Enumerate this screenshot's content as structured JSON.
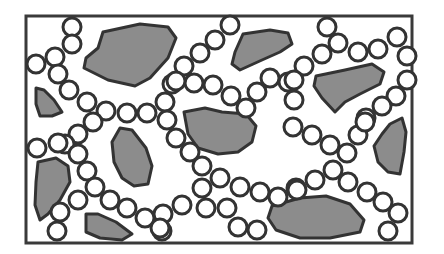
{
  "diagram": {
    "colors": {
      "background": "#ffffff",
      "outline": "#333333",
      "blob_fill": "#8c8c8c",
      "bead_fill": "#ffffff"
    },
    "frame": {
      "x": 26,
      "y": 16,
      "width": 386,
      "height": 227
    },
    "bead_radius": 9,
    "blobs": [
      {
        "points": "103,32 140,24 168,27 176,38 168,58 150,78 135,86 108,80 84,68 86,58 98,48"
      },
      {
        "points": "243,34 270,30 288,33 292,44 280,52 262,60 240,70 232,64 235,52"
      },
      {
        "points": "316,76 345,70 372,64 384,72 380,84 360,94 345,102 335,112 322,98 314,86"
      },
      {
        "points": "36,88 44,90 54,100 62,112 52,116 40,116 36,104"
      },
      {
        "points": "184,112 205,108 222,112 246,114 256,126 252,142 238,152 218,154 198,148 188,134"
      },
      {
        "points": "38,162 56,158 68,166 70,182 60,200 48,214 40,220 35,205 36,182"
      },
      {
        "points": "120,128 132,130 146,148 152,166 148,184 134,186 122,178 114,162 112,142"
      },
      {
        "points": "86,214 98,214 116,222 132,234 122,240 100,238 86,232"
      },
      {
        "points": "390,124 402,118 406,132 404,152 400,174 388,172 378,162 374,146 382,134"
      },
      {
        "points": "272,206 300,198 326,196 350,204 364,220 360,232 330,238 300,238 276,230 268,218"
      }
    ],
    "beads": [
      [
        72,
        27
      ],
      [
        72,
        44
      ],
      [
        55,
        57
      ],
      [
        36,
        64
      ],
      [
        58,
        74
      ],
      [
        69,
        90
      ],
      [
        87,
        102
      ],
      [
        106,
        111
      ],
      [
        127,
        113
      ],
      [
        147,
        113
      ],
      [
        165,
        102
      ],
      [
        172,
        84
      ],
      [
        194,
        83
      ],
      [
        213,
        85
      ],
      [
        231,
        96
      ],
      [
        246,
        108
      ],
      [
        257,
        92
      ],
      [
        270,
        78
      ],
      [
        288,
        82
      ],
      [
        294,
        100
      ],
      [
        230,
        25
      ],
      [
        215,
        40
      ],
      [
        200,
        53
      ],
      [
        184,
        66
      ],
      [
        176,
        81
      ],
      [
        327,
        27
      ],
      [
        338,
        43
      ],
      [
        322,
        54
      ],
      [
        304,
        66
      ],
      [
        358,
        52
      ],
      [
        378,
        49
      ],
      [
        397,
        37
      ],
      [
        407,
        56
      ],
      [
        407,
        80
      ],
      [
        396,
        96
      ],
      [
        382,
        106
      ],
      [
        366,
        118
      ],
      [
        294,
        80
      ],
      [
        93,
        122
      ],
      [
        78,
        134
      ],
      [
        65,
        144
      ],
      [
        58,
        143
      ],
      [
        37,
        148
      ],
      [
        167,
        120
      ],
      [
        176,
        138
      ],
      [
        190,
        152
      ],
      [
        202,
        166
      ],
      [
        220,
        178
      ],
      [
        240,
        187
      ],
      [
        260,
        192
      ],
      [
        278,
        197
      ],
      [
        296,
        188
      ],
      [
        202,
        188
      ],
      [
        182,
        205
      ],
      [
        163,
        214
      ],
      [
        162,
        231
      ],
      [
        206,
        208
      ],
      [
        227,
        208
      ],
      [
        238,
        227
      ],
      [
        257,
        230
      ],
      [
        293,
        127
      ],
      [
        312,
        135
      ],
      [
        330,
        145
      ],
      [
        347,
        153
      ],
      [
        358,
        135
      ],
      [
        365,
        122
      ],
      [
        333,
        170
      ],
      [
        348,
        182
      ],
      [
        367,
        192
      ],
      [
        383,
        202
      ],
      [
        398,
        213
      ],
      [
        388,
        231
      ],
      [
        315,
        180
      ],
      [
        297,
        190
      ],
      [
        78,
        154
      ],
      [
        87,
        171
      ],
      [
        95,
        187
      ],
      [
        78,
        200
      ],
      [
        60,
        212
      ],
      [
        57,
        231
      ],
      [
        110,
        200
      ],
      [
        127,
        208
      ],
      [
        145,
        218
      ],
      [
        160,
        228
      ]
    ]
  }
}
